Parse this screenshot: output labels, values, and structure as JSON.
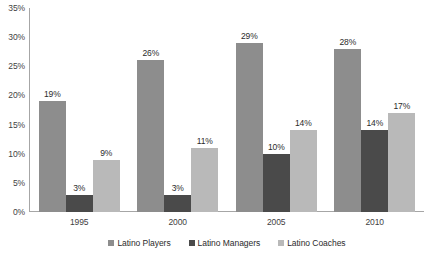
{
  "chart_data": {
    "type": "bar",
    "title": "",
    "xlabel": "",
    "ylabel": "",
    "categories": [
      "1995",
      "2000",
      "2005",
      "2010"
    ],
    "series": [
      {
        "name": "Latino Players",
        "values": [
          19,
          26,
          29,
          28
        ],
        "color": "#8d8d8d"
      },
      {
        "name": "Latino Managers",
        "values": [
          3,
          3,
          10,
          14
        ],
        "color": "#4a4a4a"
      },
      {
        "name": "Latino Coaches",
        "values": [
          9,
          11,
          14,
          17
        ],
        "color": "#b9b9b9"
      }
    ],
    "data_labels": [
      [
        "19%",
        "3%",
        "9%"
      ],
      [
        "26%",
        "3%",
        "11%"
      ],
      [
        "29%",
        "10%",
        "14%"
      ],
      [
        "28%",
        "14%",
        "17%"
      ]
    ],
    "ylim": [
      0,
      35
    ],
    "ytick_values": [
      35,
      30,
      25,
      20,
      15,
      10,
      5,
      0
    ],
    "ytick_labels": [
      "35%",
      "30%",
      "25%",
      "20%",
      "15%",
      "10%",
      "5%",
      "0%"
    ],
    "grid": false,
    "legend_position": "bottom"
  },
  "legend": {
    "items": [
      {
        "label": "Latino Players",
        "color": "#8d8d8d"
      },
      {
        "label": "Latino Managers",
        "color": "#4a4a4a"
      },
      {
        "label": "Latino Coaches",
        "color": "#b9b9b9"
      }
    ]
  },
  "caption": {
    "text": ""
  },
  "colors": {
    "axis": "#a6a6a6",
    "tick_text": "#3f3f3f",
    "label_text": "#2b2b2b",
    "background": "#ffffff"
  }
}
